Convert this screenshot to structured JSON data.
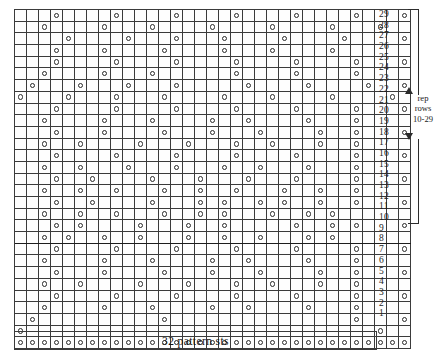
{
  "chart_data": {
    "type": "heatmap",
    "xlabel": "32 pattern sts",
    "ylabel": "row number",
    "grid": true,
    "columns": 33,
    "rows": 29,
    "symbol_legend": {
      "o": "yarn over",
      "": "empty / plain stitch"
    },
    "row_labels": [
      "29",
      "28",
      "27",
      "26",
      "25",
      "24",
      "23",
      "22",
      "21",
      "20",
      "19",
      "18",
      "17",
      "16",
      "15",
      "14",
      "13",
      "12",
      "11",
      "10",
      "9",
      "8",
      "7",
      "6",
      "5",
      "4",
      "3",
      "2",
      "1"
    ],
    "cells": [
      [
        0,
        0,
        0,
        1,
        0,
        0,
        0,
        0,
        1,
        0,
        0,
        0,
        0,
        1,
        0,
        0,
        0,
        0,
        1,
        0,
        0,
        0,
        0,
        1,
        0,
        0,
        0,
        0,
        1,
        0,
        0,
        0,
        1
      ],
      [
        0,
        0,
        1,
        0,
        0,
        0,
        0,
        1,
        0,
        0,
        0,
        1,
        0,
        0,
        0,
        0,
        1,
        0,
        0,
        0,
        0,
        1,
        0,
        0,
        0,
        0,
        1,
        0,
        0,
        0,
        1,
        0,
        0
      ],
      [
        0,
        0,
        0,
        0,
        1,
        0,
        0,
        0,
        0,
        1,
        0,
        0,
        0,
        1,
        0,
        0,
        0,
        1,
        0,
        0,
        0,
        0,
        1,
        0,
        0,
        0,
        0,
        1,
        0,
        0,
        0,
        0,
        1
      ],
      [
        0,
        0,
        0,
        1,
        0,
        0,
        0,
        1,
        0,
        0,
        0,
        0,
        1,
        0,
        0,
        0,
        0,
        1,
        0,
        0,
        0,
        1,
        0,
        0,
        0,
        0,
        1,
        0,
        0,
        0,
        0,
        0,
        0
      ],
      [
        0,
        0,
        0,
        1,
        0,
        0,
        0,
        0,
        1,
        0,
        0,
        0,
        0,
        1,
        0,
        0,
        0,
        0,
        1,
        0,
        0,
        0,
        0,
        1,
        0,
        0,
        0,
        0,
        1,
        0,
        0,
        0,
        1
      ],
      [
        0,
        0,
        1,
        0,
        0,
        0,
        0,
        1,
        0,
        0,
        0,
        1,
        0,
        0,
        0,
        0,
        0,
        0,
        1,
        0,
        0,
        0,
        0,
        1,
        0,
        0,
        0,
        0,
        1,
        0,
        0,
        0,
        0
      ],
      [
        0,
        1,
        0,
        0,
        0,
        1,
        0,
        0,
        0,
        1,
        0,
        0,
        0,
        1,
        0,
        0,
        0,
        0,
        0,
        1,
        0,
        0,
        0,
        0,
        1,
        0,
        0,
        0,
        0,
        1,
        0,
        0,
        1
      ],
      [
        1,
        0,
        0,
        0,
        1,
        0,
        0,
        0,
        1,
        0,
        0,
        0,
        1,
        0,
        0,
        0,
        0,
        1,
        0,
        0,
        0,
        1,
        0,
        0,
        0,
        0,
        1,
        0,
        0,
        0,
        0,
        1,
        0
      ],
      [
        0,
        0,
        0,
        1,
        0,
        0,
        0,
        0,
        1,
        0,
        0,
        0,
        0,
        1,
        0,
        0,
        0,
        0,
        1,
        0,
        0,
        0,
        0,
        1,
        0,
        0,
        0,
        0,
        1,
        0,
        0,
        0,
        1
      ],
      [
        0,
        0,
        1,
        0,
        0,
        0,
        0,
        1,
        0,
        0,
        0,
        1,
        0,
        0,
        0,
        0,
        1,
        0,
        0,
        1,
        0,
        0,
        0,
        0,
        1,
        0,
        0,
        0,
        1,
        0,
        0,
        0,
        0
      ],
      [
        0,
        0,
        0,
        1,
        0,
        0,
        0,
        1,
        0,
        0,
        0,
        0,
        1,
        0,
        0,
        0,
        1,
        0,
        0,
        0,
        1,
        0,
        0,
        0,
        0,
        1,
        0,
        0,
        1,
        0,
        0,
        0,
        1
      ],
      [
        0,
        0,
        1,
        0,
        0,
        1,
        0,
        0,
        0,
        0,
        1,
        0,
        0,
        0,
        1,
        0,
        0,
        0,
        1,
        0,
        0,
        1,
        0,
        0,
        0,
        1,
        0,
        0,
        1,
        0,
        0,
        0,
        0
      ],
      [
        0,
        0,
        0,
        1,
        0,
        0,
        0,
        0,
        1,
        0,
        0,
        0,
        0,
        1,
        0,
        0,
        0,
        0,
        1,
        0,
        0,
        0,
        0,
        1,
        0,
        0,
        0,
        0,
        1,
        0,
        0,
        0,
        1
      ],
      [
        0,
        0,
        1,
        0,
        0,
        1,
        0,
        0,
        0,
        1,
        0,
        0,
        0,
        1,
        0,
        0,
        0,
        1,
        0,
        0,
        1,
        0,
        0,
        0,
        1,
        0,
        0,
        0,
        1,
        0,
        0,
        0,
        0
      ],
      [
        0,
        0,
        0,
        1,
        0,
        0,
        1,
        0,
        0,
        0,
        0,
        1,
        0,
        0,
        0,
        1,
        0,
        0,
        0,
        1,
        0,
        0,
        0,
        1,
        0,
        0,
        0,
        0,
        1,
        0,
        0,
        0,
        1
      ],
      [
        0,
        0,
        1,
        0,
        0,
        1,
        0,
        0,
        1,
        0,
        0,
        0,
        1,
        0,
        0,
        1,
        0,
        0,
        1,
        0,
        0,
        0,
        1,
        0,
        0,
        1,
        0,
        0,
        1,
        0,
        0,
        0,
        0
      ],
      [
        0,
        0,
        0,
        1,
        0,
        0,
        1,
        0,
        0,
        0,
        0,
        1,
        0,
        0,
        0,
        1,
        0,
        1,
        0,
        0,
        1,
        0,
        1,
        0,
        0,
        1,
        0,
        0,
        1,
        0,
        0,
        0,
        1
      ],
      [
        0,
        0,
        1,
        0,
        0,
        1,
        0,
        0,
        1,
        0,
        0,
        0,
        1,
        0,
        0,
        1,
        0,
        1,
        0,
        0,
        0,
        1,
        0,
        0,
        1,
        0,
        1,
        0,
        0,
        0,
        0,
        0,
        0
      ],
      [
        0,
        0,
        0,
        1,
        0,
        1,
        0,
        0,
        0,
        0,
        1,
        0,
        0,
        0,
        1,
        0,
        0,
        1,
        0,
        0,
        0,
        0,
        0,
        1,
        0,
        0,
        1,
        0,
        1,
        0,
        0,
        0,
        1
      ],
      [
        0,
        0,
        1,
        0,
        1,
        0,
        0,
        1,
        0,
        0,
        1,
        0,
        0,
        0,
        1,
        0,
        0,
        1,
        0,
        0,
        1,
        0,
        0,
        0,
        1,
        0,
        1,
        0,
        0,
        0,
        0,
        0,
        0
      ],
      [
        0,
        0,
        0,
        1,
        0,
        0,
        0,
        0,
        1,
        0,
        0,
        0,
        0,
        1,
        0,
        0,
        0,
        0,
        1,
        0,
        0,
        0,
        0,
        1,
        0,
        0,
        0,
        0,
        1,
        0,
        0,
        0,
        1
      ],
      [
        0,
        0,
        1,
        0,
        0,
        0,
        0,
        1,
        0,
        0,
        0,
        1,
        0,
        0,
        0,
        0,
        1,
        0,
        0,
        1,
        0,
        0,
        0,
        0,
        1,
        0,
        0,
        0,
        1,
        0,
        0,
        0,
        0
      ],
      [
        0,
        0,
        0,
        1,
        0,
        0,
        0,
        1,
        0,
        0,
        0,
        0,
        1,
        0,
        0,
        0,
        1,
        0,
        0,
        0,
        1,
        0,
        0,
        0,
        0,
        1,
        0,
        0,
        1,
        0,
        0,
        0,
        1
      ],
      [
        0,
        0,
        1,
        0,
        0,
        1,
        0,
        0,
        0,
        0,
        1,
        0,
        0,
        0,
        1,
        0,
        0,
        0,
        1,
        0,
        0,
        1,
        0,
        0,
        0,
        1,
        0,
        0,
        1,
        0,
        0,
        0,
        0
      ],
      [
        0,
        0,
        0,
        1,
        0,
        0,
        0,
        0,
        1,
        0,
        0,
        0,
        0,
        1,
        0,
        0,
        0,
        0,
        1,
        0,
        0,
        0,
        0,
        1,
        0,
        0,
        0,
        0,
        1,
        0,
        0,
        0,
        1
      ],
      [
        0,
        0,
        1,
        0,
        0,
        0,
        0,
        1,
        0,
        0,
        0,
        1,
        0,
        0,
        0,
        0,
        1,
        0,
        0,
        1,
        0,
        0,
        0,
        0,
        1,
        0,
        0,
        0,
        1,
        0,
        0,
        0,
        0
      ],
      [
        0,
        1,
        0,
        0,
        0,
        0,
        0,
        0,
        0,
        0,
        0,
        0,
        1,
        0,
        0,
        0,
        0,
        0,
        0,
        0,
        0,
        0,
        0,
        0,
        0,
        0,
        0,
        0,
        1,
        0,
        0,
        0,
        1
      ],
      [
        1,
        0,
        0,
        0,
        0,
        0,
        0,
        0,
        0,
        0,
        0,
        0,
        0,
        0,
        0,
        0,
        0,
        0,
        0,
        0,
        0,
        0,
        0,
        0,
        0,
        0,
        0,
        0,
        0,
        0,
        1,
        0,
        0
      ],
      [
        1,
        1,
        1,
        1,
        1,
        1,
        1,
        1,
        1,
        1,
        1,
        1,
        1,
        1,
        1,
        1,
        1,
        1,
        1,
        1,
        1,
        1,
        1,
        1,
        1,
        1,
        1,
        1,
        1,
        1,
        1,
        1,
        1
      ]
    ],
    "band_edge_after_row_label": "10",
    "annotations": [
      {
        "id": "repeat",
        "text": "rep rows 10-29",
        "lines": [
          "rep",
          "rows",
          "10-29"
        ]
      },
      {
        "id": "width",
        "text": "32 pattern sts"
      }
    ]
  },
  "footer": {
    "sts_label": "32 pattern sts"
  },
  "repeat": {
    "line1": "rep",
    "line2": "rows",
    "line3": "10-29"
  }
}
